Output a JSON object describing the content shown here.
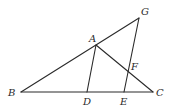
{
  "diagram": {
    "type": "geometry",
    "points": {
      "A": {
        "x": 96,
        "y": 45,
        "label": "A",
        "lx": 89,
        "ly": 42
      },
      "B": {
        "x": 21,
        "y": 92,
        "label": "B",
        "lx": 8,
        "ly": 96
      },
      "C": {
        "x": 153,
        "y": 92,
        "label": "C",
        "lx": 156,
        "ly": 96
      },
      "D": {
        "x": 87,
        "y": 92,
        "label": "D",
        "lx": 83,
        "ly": 105
      },
      "E": {
        "x": 124,
        "y": 92,
        "label": "E",
        "lx": 120,
        "ly": 105
      },
      "F": {
        "x": 129,
        "y": 71,
        "label": "F",
        "lx": 131,
        "ly": 70
      },
      "G": {
        "x": 139,
        "y": 18,
        "label": "G",
        "lx": 141,
        "ly": 15
      }
    },
    "segments": [
      [
        "B",
        "G"
      ],
      [
        "B",
        "C"
      ],
      [
        "A",
        "C"
      ],
      [
        "A",
        "D"
      ],
      [
        "G",
        "E"
      ]
    ]
  }
}
